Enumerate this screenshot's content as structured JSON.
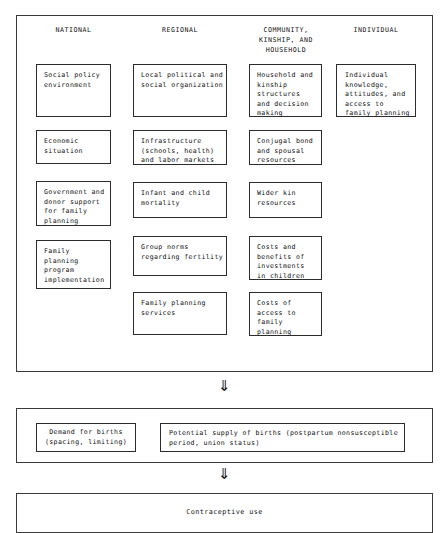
{
  "diagram": {
    "columns": [
      {
        "id": "national",
        "label": "NATIONAL"
      },
      {
        "id": "regional",
        "label": "REGIONAL"
      },
      {
        "id": "community",
        "label": "COMMUNITY,\nKINSHIP, AND\nHOUSEHOLD"
      },
      {
        "id": "individual",
        "label": "INDIVIDUAL"
      }
    ],
    "national_nodes": [
      {
        "text": "Social policy\nenvironment"
      },
      {
        "text": "Economic\nsituation"
      },
      {
        "text": "Government and\ndonor support\nfor family\nplanning"
      },
      {
        "text": "Family\nplanning\nprogram\nimplementation"
      }
    ],
    "regional_nodes": [
      {
        "text": "Local political and\nsocial organization"
      },
      {
        "text": "Infrastructure\n(schools, health)\nand labor markets"
      },
      {
        "text": "Infant and child\nmortality"
      },
      {
        "text": "Group norms\nregarding fertility"
      },
      {
        "text": "Family planning\nservices"
      }
    ],
    "community_nodes": [
      {
        "text": "Household and\nkinship\nstructures\nand decision\nmaking"
      },
      {
        "text": "Conjugal bond\nand spousal\nresources"
      },
      {
        "text": "Wider kin\nresources"
      },
      {
        "text": "Costs and\nbenefits of\ninvestments\nin children"
      },
      {
        "text": "Costs of\naccess to\nfamily\nplanning"
      }
    ],
    "individual_nodes": [
      {
        "text": "Individual\nknowledge,\nattitudes, and\naccess to\nfamily planning"
      }
    ],
    "demand_supply_nodes": [
      {
        "text": "Demand for births\n(spacing, limiting)"
      },
      {
        "text": "Potential supply of births (postpartum nonsusceptible\nperiod, union status)"
      }
    ],
    "outcome_node": {
      "text": "Contraceptive use"
    },
    "arrows": [
      {
        "id": "arrow-1",
        "glyph": "⇓"
      },
      {
        "id": "arrow-2",
        "glyph": "⇓"
      }
    ],
    "colors": {
      "background": "#ffffff",
      "box_border": "#2c2c2c",
      "panel_border": "#3a3a3a",
      "text": "#111111"
    }
  }
}
